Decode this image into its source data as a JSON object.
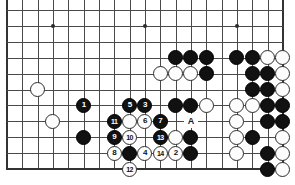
{
  "board": {
    "type": "go-diagram",
    "cols": 19,
    "rows": 11,
    "origin": {
      "x": 7,
      "y": 10
    },
    "spacing": {
      "x": 15.33,
      "y": 15.9
    },
    "edges": {
      "left": true,
      "right": true,
      "bottom": true,
      "top": false
    },
    "star_points": [
      {
        "col": 3,
        "row": 1
      },
      {
        "col": 9,
        "row": 1
      },
      {
        "col": 15,
        "row": 1
      }
    ],
    "colors": {
      "black": "#111111",
      "white": "#fdfdfd",
      "line": "#4a4a4a",
      "edge": "#333333",
      "background": "#ffffff",
      "black_label": "#ffffff",
      "white_label": "#111111"
    },
    "stones": [
      {
        "col": 2,
        "row": 5,
        "color": "white",
        "label": ""
      },
      {
        "col": 3,
        "row": 7,
        "color": "white",
        "label": ""
      },
      {
        "col": 5,
        "row": 6,
        "color": "black",
        "label": "1"
      },
      {
        "col": 5,
        "row": 8,
        "color": "black",
        "label": ""
      },
      {
        "col": 7,
        "row": 7,
        "color": "black",
        "label": "11"
      },
      {
        "col": 7,
        "row": 8,
        "color": "black",
        "label": "9"
      },
      {
        "col": 7,
        "row": 9,
        "color": "white",
        "label": "8"
      },
      {
        "col": 8,
        "row": 6,
        "color": "black",
        "label": "5"
      },
      {
        "col": 8,
        "row": 7,
        "color": "white",
        "label": ""
      },
      {
        "col": 8,
        "row": 8,
        "color": "white",
        "label": "10"
      },
      {
        "col": 8,
        "row": 9,
        "color": "black",
        "label": ""
      },
      {
        "col": 8,
        "row": 10,
        "color": "white",
        "label": "12"
      },
      {
        "col": 9,
        "row": 6,
        "color": "black",
        "label": "3"
      },
      {
        "col": 9,
        "row": 7,
        "color": "white",
        "label": "6"
      },
      {
        "col": 9,
        "row": 9,
        "color": "white",
        "label": "4"
      },
      {
        "col": 10,
        "row": 4,
        "color": "white",
        "label": ""
      },
      {
        "col": 10,
        "row": 7,
        "color": "black",
        "label": "7"
      },
      {
        "col": 10,
        "row": 8,
        "color": "black",
        "label": "13"
      },
      {
        "col": 10,
        "row": 9,
        "color": "white",
        "label": "14"
      },
      {
        "col": 11,
        "row": 3,
        "color": "black",
        "label": ""
      },
      {
        "col": 11,
        "row": 4,
        "color": "white",
        "label": ""
      },
      {
        "col": 11,
        "row": 6,
        "color": "black",
        "label": ""
      },
      {
        "col": 11,
        "row": 8,
        "color": "white",
        "label": ""
      },
      {
        "col": 11,
        "row": 9,
        "color": "white",
        "label": "2"
      },
      {
        "col": 12,
        "row": 3,
        "color": "black",
        "label": ""
      },
      {
        "col": 12,
        "row": 4,
        "color": "white",
        "label": ""
      },
      {
        "col": 12,
        "row": 6,
        "color": "black",
        "label": ""
      },
      {
        "col": 12,
        "row": 8,
        "color": "black",
        "label": ""
      },
      {
        "col": 12,
        "row": 9,
        "color": "black",
        "label": ""
      },
      {
        "col": 13,
        "row": 3,
        "color": "black",
        "label": ""
      },
      {
        "col": 13,
        "row": 4,
        "color": "black",
        "label": ""
      },
      {
        "col": 13,
        "row": 6,
        "color": "white",
        "label": ""
      },
      {
        "col": 15,
        "row": 3,
        "color": "black",
        "label": ""
      },
      {
        "col": 15,
        "row": 6,
        "color": "white",
        "label": ""
      },
      {
        "col": 15,
        "row": 7,
        "color": "white",
        "label": ""
      },
      {
        "col": 15,
        "row": 8,
        "color": "white",
        "label": ""
      },
      {
        "col": 15,
        "row": 9,
        "color": "white",
        "label": ""
      },
      {
        "col": 16,
        "row": 3,
        "color": "black",
        "label": ""
      },
      {
        "col": 16,
        "row": 4,
        "color": "black",
        "label": ""
      },
      {
        "col": 16,
        "row": 5,
        "color": "black",
        "label": ""
      },
      {
        "col": 16,
        "row": 6,
        "color": "white",
        "label": ""
      },
      {
        "col": 16,
        "row": 8,
        "color": "black",
        "label": ""
      },
      {
        "col": 17,
        "row": 3,
        "color": "white",
        "label": ""
      },
      {
        "col": 17,
        "row": 4,
        "color": "black",
        "label": ""
      },
      {
        "col": 17,
        "row": 5,
        "color": "black",
        "label": ""
      },
      {
        "col": 17,
        "row": 6,
        "color": "black",
        "label": ""
      },
      {
        "col": 17,
        "row": 7,
        "color": "black",
        "label": ""
      },
      {
        "col": 17,
        "row": 9,
        "color": "black",
        "label": ""
      },
      {
        "col": 17,
        "row": 10,
        "color": "black",
        "label": ""
      },
      {
        "col": 18,
        "row": 3,
        "color": "white",
        "label": ""
      },
      {
        "col": 18,
        "row": 4,
        "color": "white",
        "label": ""
      },
      {
        "col": 18,
        "row": 5,
        "color": "white",
        "label": ""
      },
      {
        "col": 18,
        "row": 6,
        "color": "black",
        "label": ""
      },
      {
        "col": 18,
        "row": 7,
        "color": "black",
        "label": ""
      },
      {
        "col": 18,
        "row": 8,
        "color": "white",
        "label": ""
      },
      {
        "col": 18,
        "row": 9,
        "color": "white",
        "label": ""
      },
      {
        "col": 18,
        "row": 10,
        "color": "white",
        "label": ""
      }
    ],
    "markers": [
      {
        "col": 12,
        "row": 7,
        "text": "A"
      }
    ],
    "extra_star_point": {
      "col": 15,
      "row": 7
    }
  }
}
